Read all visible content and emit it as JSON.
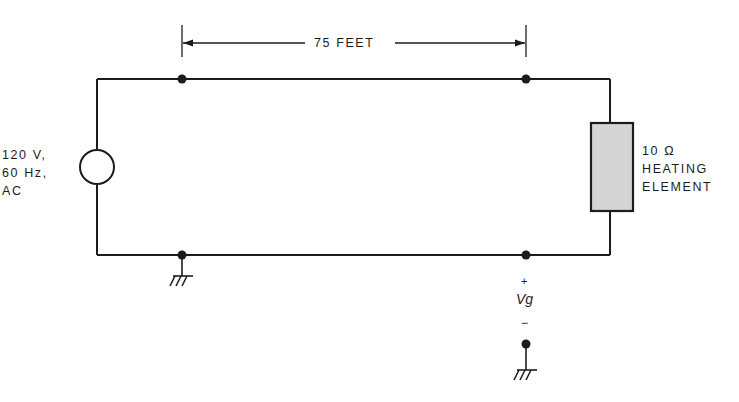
{
  "diagram": {
    "type": "circuit-schematic",
    "source": {
      "label_lines": [
        "120 V,",
        "60 Hz,",
        "AC"
      ],
      "symbol": "ac-voltage-source"
    },
    "dimension": {
      "label": "75 FEET"
    },
    "load": {
      "label_lines": [
        "10 Ω",
        "HEATING",
        "ELEMENT"
      ],
      "symbol": "resistor-block",
      "fill_color": "#d4d4d4"
    },
    "measurement": {
      "plus": "+",
      "label": "Vg",
      "minus": "−"
    },
    "colors": {
      "line": "#1c1c1c",
      "background": "#ffffff"
    }
  }
}
